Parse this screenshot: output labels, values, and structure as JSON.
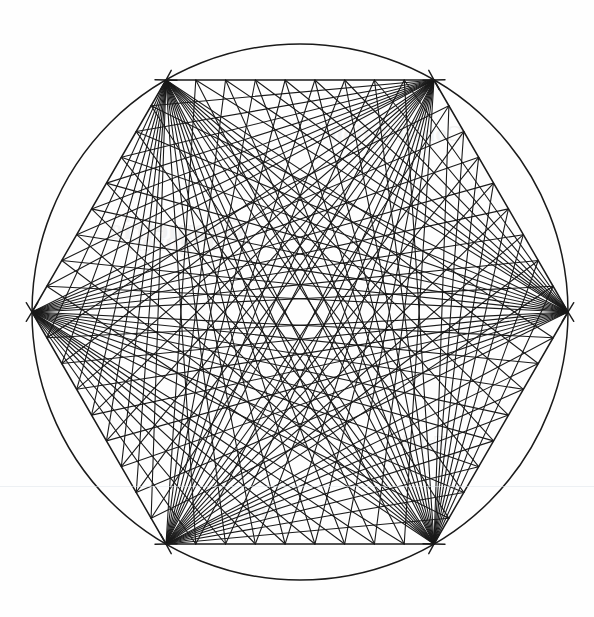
{
  "figure": {
    "type": "geometric-line-construction",
    "canvas": {
      "width": 594,
      "height": 617,
      "background": "#fefefe"
    },
    "ink_color": "#1a1a1a",
    "circle": {
      "label": "Circumscribed circle",
      "cx": 300,
      "cy": 312,
      "r": 268,
      "stroke_width": 1.5
    },
    "hexagon": {
      "label": "Inscribed hexagon",
      "sides": 6,
      "stroke_width": 1.5,
      "vertices": [
        {
          "name": "left",
          "x": 32,
          "y": 312
        },
        {
          "name": "top-left",
          "x": 166,
          "y": 80
        },
        {
          "name": "top-right",
          "x": 434,
          "y": 80
        },
        {
          "name": "right",
          "x": 568,
          "y": 312
        },
        {
          "name": "bottom-right",
          "x": 434,
          "y": 544
        },
        {
          "name": "bottom-left",
          "x": 166,
          "y": 544
        }
      ]
    },
    "string_art": {
      "label": "Radiating chord fans forming a six-point star envelope",
      "divisions": 9,
      "stroke_width": 1.1,
      "fan_offsets": [
        2,
        3,
        4
      ],
      "description": "From each hexagon vertex, straight chords are drawn to evenly spaced division points along the non-adjacent hexagon edges. The accumulated chords envelope a concave six-pointed star."
    },
    "vertex_ticks": {
      "label": "Compass / construction tick marks at each vertex",
      "length": 22,
      "stroke_width": 1.4,
      "count_per_vertex": 2
    },
    "watermarks": [
      {
        "text": "Geometrie",
        "x": 110,
        "y": 212,
        "size": 30,
        "rotate": -1
      },
      {
        "text": "Figuren",
        "x": 128,
        "y": 228,
        "size": 26,
        "rotate": 0
      },
      {
        "text": "Construction",
        "x": 330,
        "y": 120,
        "size": 24,
        "rotate": 0
      },
      {
        "text": "Tafel",
        "x": 402,
        "y": 430,
        "size": 22,
        "rotate": 0
      },
      {
        "text": "Kreis",
        "x": 236,
        "y": 500,
        "size": 20,
        "rotate": 0
      }
    ],
    "paper_rules": [
      {
        "x": 0,
        "y": 486,
        "width": 594
      },
      {
        "x": 0,
        "y": 487,
        "width": 594
      }
    ]
  }
}
